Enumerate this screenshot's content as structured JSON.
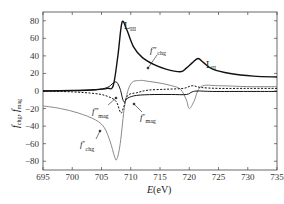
{
  "chart_data": {
    "type": "line",
    "title": "",
    "xlabel": "E(eV)",
    "ylabel": "f_chg, f_mag",
    "xlim": [
      695,
      735
    ],
    "ylim": [
      -90,
      90
    ],
    "xticks": [
      695,
      700,
      705,
      710,
      715,
      720,
      725,
      730,
      735
    ],
    "yticks": [
      -80,
      -60,
      -40,
      -20,
      0,
      20,
      40,
      60,
      80
    ],
    "grid": false,
    "legend": "none (inline annotations)",
    "annotations": [
      {
        "text": "L_III",
        "x": 710.5,
        "y": 72
      },
      {
        "text": "L_II",
        "x": 723.5,
        "y": 31
      },
      {
        "text": "f''_chg",
        "x": 713.5,
        "y": 53
      },
      {
        "text": "f''_mag",
        "x": 704.5,
        "y": -18
      },
      {
        "text": "f'_mag",
        "x": 711.5,
        "y": -26
      },
      {
        "text": "f'_chg",
        "x": 703,
        "y": -62
      }
    ],
    "series": [
      {
        "name": "f''_chg",
        "style": "solid black thick",
        "x": [
          695,
          700,
          704,
          706,
          707,
          707.8,
          708.5,
          709.3,
          710.5,
          712,
          714,
          716,
          718.5,
          719.5,
          720.5,
          721.5,
          722.5,
          724,
          727,
          731,
          735
        ],
        "y": [
          0,
          0.5,
          1.5,
          3,
          6,
          40,
          78,
          70,
          50,
          38,
          30,
          25,
          22,
          26,
          32,
          37,
          32,
          25,
          20,
          17,
          16
        ]
      },
      {
        "name": "f'_chg",
        "style": "solid gray",
        "x": [
          695,
          698,
          701,
          704,
          705.5,
          706.5,
          707.2,
          707.6,
          708.2,
          709,
          710,
          711.5,
          713,
          715,
          717,
          718.5,
          719.5,
          720,
          720.8,
          722,
          725,
          730,
          735
        ],
        "y": [
          -17,
          -20,
          -25,
          -33,
          -42,
          -58,
          -74,
          -78,
          -60,
          -15,
          8,
          12,
          11,
          9,
          6,
          2,
          -10,
          -20,
          -12,
          5,
          6,
          5,
          5
        ]
      },
      {
        "name": "f''_mag",
        "style": "dashed black",
        "x": [
          695,
          700,
          704,
          706,
          707.5,
          708.3,
          708.8,
          709.5,
          711,
          713,
          716,
          719,
          720.5,
          722,
          725,
          730,
          735
        ],
        "y": [
          0,
          -1,
          -3,
          -6,
          -12,
          -25,
          -18,
          -5,
          -2,
          1,
          2,
          3,
          6,
          4,
          3,
          3,
          3
        ]
      },
      {
        "name": "f'_mag",
        "style": "solid black",
        "x": [
          695,
          700,
          704,
          706,
          707,
          707.6,
          708.2,
          708.8,
          709.5,
          711,
          714,
          717,
          719.5,
          720.5,
          721.5,
          724,
          730,
          735
        ],
        "y": [
          0,
          0.5,
          1.5,
          4,
          9,
          10,
          2,
          -12,
          -8,
          -5,
          -4,
          -4,
          -4,
          -1,
          0,
          -0.5,
          -0.5,
          -0.5
        ]
      }
    ]
  },
  "axes": {
    "x_label": "E",
    "x_unit": "(eV)",
    "y_label_main": "f",
    "y_label_sub1": "chg",
    "y_label_sep": ",",
    "y_label_sub2": "mag",
    "x_ticks": [
      "695",
      "700",
      "705",
      "710",
      "715",
      "720",
      "725",
      "730",
      "735"
    ],
    "y_ticks": [
      "80",
      "60",
      "40",
      "20",
      "0",
      "−20",
      "−40",
      "−60",
      "−80"
    ]
  },
  "labels": {
    "l3": "L",
    "l3_sub": "III",
    "l2": "L",
    "l2_sub": "II",
    "fpp_chg": "f″",
    "fpp_chg_sub": "chg",
    "fpp_mag": "f″",
    "fpp_mag_sub": "mag",
    "fp_mag": "f′",
    "fp_mag_sub": "mag",
    "fp_chg": "f′",
    "fp_chg_sub": "chg"
  },
  "colors": {
    "black_line": "#111111",
    "gray_line": "#8a8a8a",
    "axis": "#333333"
  }
}
